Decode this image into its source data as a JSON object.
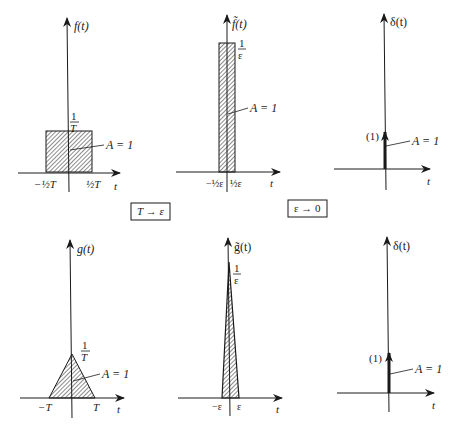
{
  "panels": {
    "f": {
      "ylabel": "f(t)",
      "xlabel": "t",
      "height_num": "1",
      "height_den": "T",
      "area": "A = 1",
      "tick_left": "−½T",
      "tick_right": "½T",
      "shape": "rectangle"
    },
    "f_tilde": {
      "ylabel": "f̃(t)",
      "xlabel": "t",
      "height_num": "1",
      "height_den": "ε",
      "area": "A = 1",
      "tick_left": "−½ε",
      "tick_right": "½ε",
      "shape": "rectangle"
    },
    "delta_top": {
      "ylabel": "δ(t)",
      "xlabel": "t",
      "weight": "(1)",
      "area": "A = 1",
      "shape": "impulse"
    },
    "g": {
      "ylabel": "g(t)",
      "xlabel": "t",
      "height_num": "1",
      "height_den": "T",
      "area": "A = 1",
      "tick_left": "−T",
      "tick_right": "T",
      "shape": "triangle"
    },
    "g_tilde": {
      "ylabel": "g̃(t)",
      "xlabel": "t",
      "height_num": "1",
      "height_den": "ε",
      "tick_left": "−ε",
      "tick_right": "ε",
      "shape": "triangle"
    },
    "delta_bottom": {
      "ylabel": "δ(t)",
      "xlabel": "t",
      "weight": "(1)",
      "area": "A = 1",
      "shape": "impulse"
    }
  },
  "transitions": {
    "first": "T → ε",
    "second": "ε → 0"
  },
  "colors": {
    "ink": "#1a1a1a",
    "background": "#ffffff"
  }
}
